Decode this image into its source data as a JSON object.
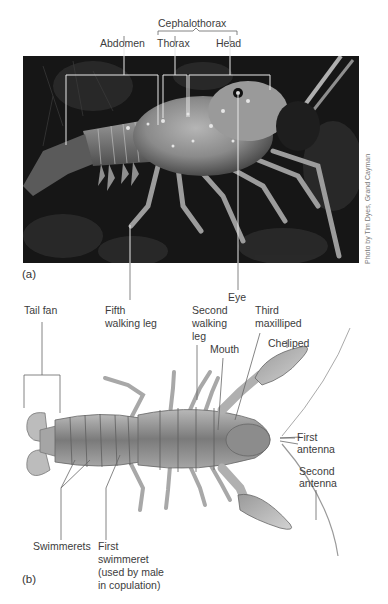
{
  "figure": {
    "panel_a": {
      "tag": "(a)",
      "credit": "Photo by Tim Dyes, Grand Cayman",
      "labels": {
        "cephalothorax": "Cephalothorax",
        "abdomen": "Abdomen",
        "thorax": "Thorax",
        "head": "Head",
        "fifth_walking_leg_line1": "Fifth",
        "fifth_walking_leg_line2": "walking leg",
        "eye": "Eye"
      }
    },
    "panel_b": {
      "tag": "(b)",
      "labels": {
        "tail_fan": "Tail fan",
        "second_walking_leg_line1": "Second",
        "second_walking_leg_line2": "walking",
        "second_walking_leg_line3": "leg",
        "mouth": "Mouth",
        "third_maxilliped_line1": "Third",
        "third_maxilliped_line2": "maxilliped",
        "cheliped": "Cheliped",
        "first_antenna_line1": "First",
        "first_antenna_line2": "antenna",
        "second_antenna_line1": "Second",
        "second_antenna_line2": "antenna",
        "swimmerets": "Swimmerets",
        "first_swimmeret_line1": "First",
        "first_swimmeret_line2": "swimmeret",
        "first_swimmeret_line3": "(used by male",
        "first_swimmeret_line4": "in copulation)"
      }
    }
  }
}
